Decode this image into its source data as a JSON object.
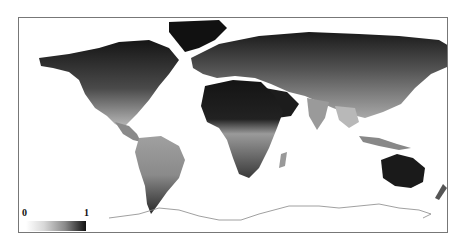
{
  "figure": {
    "type": "world-map",
    "style": "grayscale raster choropleth",
    "colors": {
      "low": "#ffffff",
      "mid": "#9a9a9a",
      "high": "#111111",
      "frame": "#777777",
      "coastline": "#888888"
    }
  },
  "legend": {
    "min_label": "0",
    "max_label": "1",
    "gradient": "white-to-black"
  }
}
